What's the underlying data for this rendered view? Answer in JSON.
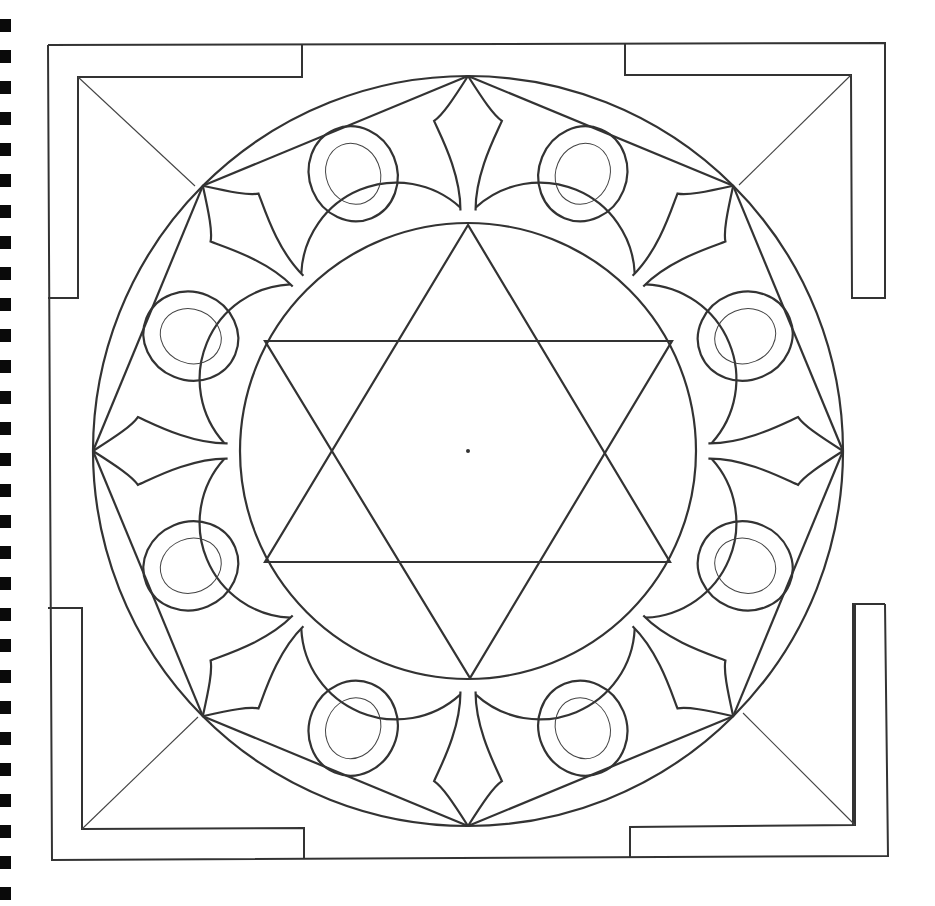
{
  "page": {
    "title": "",
    "colors": {
      "ink": "#333333",
      "paper": "#ffffff",
      "binding": "#0a0a0a"
    }
  },
  "binding": {
    "hole_count": 29,
    "first_y": 19,
    "spacing": 31
  },
  "geometry": {
    "center": [
      468,
      451
    ],
    "outer_circle_r": 375,
    "inner_circle_r": 228,
    "petal_count": 8,
    "star": "hexagram"
  }
}
